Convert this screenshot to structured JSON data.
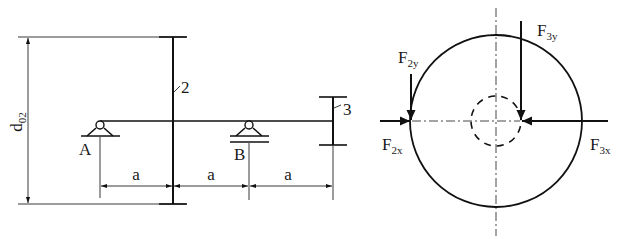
{
  "left_view": {
    "diameter_label": "d",
    "diameter_subscript": "02",
    "gear2_label": "2",
    "gear3_label": "3",
    "support_a_label": "A",
    "support_b_label": "B",
    "dimensions": [
      "a",
      "a",
      "a"
    ]
  },
  "right_view": {
    "forces": [
      {
        "name": "F",
        "subscript": "2y"
      },
      {
        "name": "F",
        "subscript": "2x"
      },
      {
        "name": "F",
        "subscript": "3y"
      },
      {
        "name": "F",
        "subscript": "3x"
      }
    ]
  },
  "colors": {
    "line": "#111111",
    "background": "#ffffff"
  }
}
